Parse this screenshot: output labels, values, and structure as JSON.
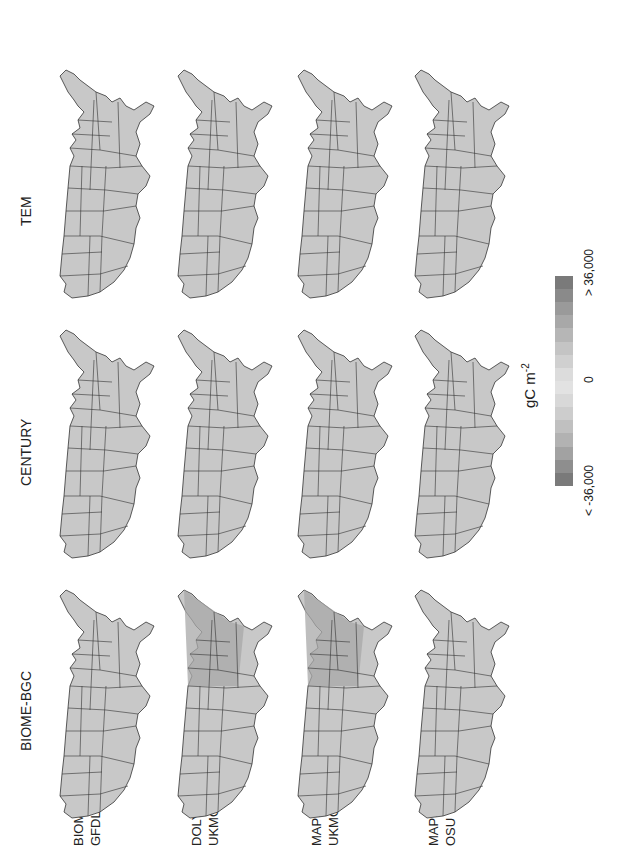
{
  "figure": {
    "columns": [
      {
        "label": "BIOME-BGC"
      },
      {
        "label": "CENTURY"
      },
      {
        "label": "TEM"
      }
    ],
    "rows": [
      {
        "line1": "BIOME2",
        "line2": "GFDL-R30"
      },
      {
        "line1": "DOLY",
        "line2": "UKMO"
      },
      {
        "line1": "MAPSS",
        "line2": "UKMO"
      },
      {
        "line1": "MAPSS",
        "line2": "OSU"
      }
    ],
    "legend": {
      "min_label": "< -36,000",
      "mid_label": "0",
      "max_label": "> 36,000",
      "unit": "gC m",
      "unit_exp": "-2",
      "colors": [
        "#7a7a7a",
        "#8e8e8e",
        "#a2a2a2",
        "#b2b2b2",
        "#c0c0c0",
        "#cdcdcd",
        "#d8d8d8",
        "#e2e2e2",
        "#dcdcdc",
        "#d0d0d0",
        "#c4c4c4",
        "#b6b6b6",
        "#a8a8a8",
        "#9a9a9a",
        "#8a8a8a",
        "#7a7a7a"
      ]
    },
    "map_fill": "#c8c8c8",
    "map_stroke": "#333333"
  }
}
